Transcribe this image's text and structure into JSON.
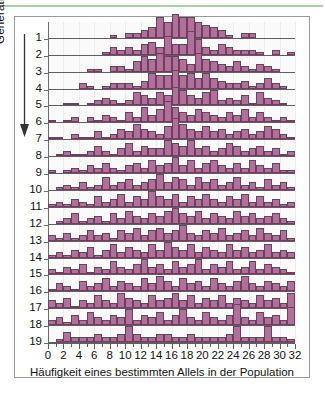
{
  "figure": {
    "y_axis_label": "Generation",
    "y_arrow_icon": "down-arrow-icon",
    "x_axis_label": "Häufigkeit eines bestimmten Allels in der Population"
  },
  "colors": {
    "bar_fill": "#b1709a",
    "bar_stroke": "#6f3f60",
    "axis": "#5e5e5e",
    "grid": "#ececf0",
    "plot_background": "#fbfafb",
    "frame": "#9a9a9a",
    "top_rule": "#a8cda8"
  },
  "chart_data": {
    "type": "bar",
    "title": "",
    "subtitle": "",
    "xlabel": "Häufigkeit eines bestimmten Allels in der Population",
    "ylabel": "Generation",
    "grid": true,
    "legend": null,
    "layout": "ridgeline / stacked small-multiple histograms, one row per generation",
    "xlim": [
      0,
      32
    ],
    "x": [
      0,
      1,
      2,
      3,
      4,
      5,
      6,
      7,
      8,
      9,
      10,
      11,
      12,
      13,
      14,
      15,
      16,
      17,
      18,
      19,
      20,
      21,
      22,
      23,
      24,
      25,
      26,
      27,
      28,
      29,
      30,
      31,
      32
    ],
    "xticks": [
      0,
      2,
      4,
      6,
      8,
      10,
      12,
      14,
      16,
      18,
      20,
      22,
      24,
      26,
      28,
      30,
      32
    ],
    "xticklabels": [
      "0",
      "2",
      "4",
      "6",
      "8",
      "10",
      "12",
      "14",
      "16",
      "18",
      "20",
      "22",
      "24",
      "26",
      "28",
      "30",
      "32"
    ],
    "minor_xticks": [
      1,
      3,
      5,
      7,
      9,
      11,
      13,
      15,
      17,
      19,
      21,
      23,
      25,
      27,
      29,
      31
    ],
    "ylabels": [
      "1",
      "2",
      "3",
      "4",
      "5",
      "6",
      "7",
      "8",
      "9",
      "10",
      "11",
      "12",
      "13",
      "14",
      "15",
      "16",
      "17",
      "18",
      "19"
    ],
    "row_max": 10,
    "series": [
      {
        "name": "1",
        "values": [
          0,
          0,
          0,
          0,
          0,
          0,
          0,
          0,
          1,
          0,
          2,
          2,
          3,
          4,
          8,
          6,
          9,
          8,
          8,
          6,
          5,
          4,
          3,
          1,
          0,
          2,
          2,
          0,
          0,
          0,
          0,
          0,
          0
        ]
      },
      {
        "name": "2",
        "values": [
          0,
          0,
          0,
          0,
          0,
          0,
          0,
          1,
          3,
          2,
          3,
          2,
          4,
          5,
          3,
          7,
          4,
          4,
          9,
          6,
          3,
          2,
          4,
          3,
          2,
          2,
          2,
          1,
          0,
          2,
          0,
          1,
          0
        ]
      },
      {
        "name": "3",
        "values": [
          0,
          0,
          0,
          0,
          0,
          1,
          1,
          0,
          2,
          2,
          1,
          4,
          6,
          5,
          7,
          6,
          6,
          5,
          3,
          7,
          5,
          4,
          3,
          2,
          4,
          2,
          1,
          3,
          2,
          1,
          0,
          0,
          0
        ]
      },
      {
        "name": "4",
        "values": [
          0,
          0,
          0,
          0,
          2,
          1,
          0,
          1,
          2,
          2,
          2,
          1,
          3,
          6,
          5,
          5,
          7,
          5,
          6,
          4,
          6,
          4,
          3,
          2,
          2,
          3,
          1,
          2,
          4,
          2,
          1,
          0,
          0
        ]
      },
      {
        "name": "5",
        "values": [
          0,
          0,
          1,
          1,
          0,
          1,
          2,
          3,
          2,
          1,
          2,
          5,
          4,
          3,
          5,
          4,
          7,
          6,
          4,
          3,
          5,
          6,
          2,
          3,
          2,
          4,
          1,
          5,
          3,
          2,
          1,
          0,
          0
        ]
      },
      {
        "name": "6",
        "values": [
          1,
          0,
          1,
          2,
          0,
          2,
          1,
          3,
          2,
          1,
          4,
          2,
          6,
          3,
          5,
          8,
          6,
          4,
          3,
          5,
          4,
          3,
          2,
          4,
          3,
          5,
          2,
          4,
          2,
          1,
          2,
          1,
          0
        ]
      },
      {
        "name": "7",
        "values": [
          1,
          1,
          0,
          2,
          1,
          1,
          3,
          1,
          2,
          4,
          3,
          6,
          4,
          3,
          2,
          5,
          8,
          6,
          4,
          3,
          5,
          3,
          4,
          2,
          3,
          4,
          2,
          3,
          5,
          4,
          2,
          1,
          0
        ]
      },
      {
        "name": "8",
        "values": [
          0,
          1,
          2,
          1,
          1,
          2,
          4,
          2,
          1,
          3,
          5,
          2,
          4,
          3,
          3,
          6,
          5,
          4,
          6,
          3,
          4,
          2,
          3,
          5,
          4,
          2,
          3,
          4,
          2,
          3,
          1,
          2,
          0
        ]
      },
      {
        "name": "9",
        "values": [
          1,
          0,
          1,
          2,
          1,
          3,
          2,
          4,
          2,
          1,
          3,
          4,
          2,
          5,
          3,
          4,
          6,
          3,
          5,
          2,
          4,
          5,
          3,
          2,
          4,
          2,
          5,
          3,
          2,
          4,
          1,
          1,
          0
        ]
      },
      {
        "name": "10",
        "values": [
          0,
          1,
          2,
          1,
          3,
          1,
          2,
          5,
          2,
          3,
          4,
          2,
          3,
          4,
          6,
          3,
          5,
          4,
          2,
          5,
          3,
          4,
          2,
          3,
          5,
          2,
          3,
          1,
          4,
          2,
          3,
          1,
          0
        ]
      },
      {
        "name": "11",
        "values": [
          1,
          2,
          1,
          3,
          2,
          1,
          4,
          2,
          3,
          5,
          2,
          4,
          3,
          6,
          4,
          3,
          5,
          2,
          4,
          3,
          5,
          3,
          2,
          4,
          3,
          5,
          2,
          4,
          2,
          3,
          1,
          2,
          0
        ]
      },
      {
        "name": "12",
        "values": [
          0,
          1,
          2,
          4,
          1,
          2,
          3,
          1,
          4,
          2,
          5,
          3,
          2,
          4,
          3,
          5,
          6,
          4,
          3,
          5,
          2,
          4,
          3,
          2,
          5,
          3,
          4,
          2,
          3,
          4,
          2,
          1,
          0
        ]
      },
      {
        "name": "13",
        "values": [
          2,
          1,
          3,
          1,
          2,
          4,
          2,
          3,
          1,
          4,
          3,
          5,
          2,
          4,
          5,
          3,
          4,
          6,
          3,
          2,
          4,
          3,
          5,
          2,
          3,
          4,
          2,
          5,
          3,
          2,
          4,
          1,
          0
        ]
      },
      {
        "name": "14",
        "values": [
          1,
          2,
          1,
          3,
          2,
          4,
          1,
          3,
          5,
          2,
          4,
          3,
          2,
          5,
          3,
          6,
          4,
          3,
          5,
          2,
          4,
          3,
          2,
          5,
          3,
          4,
          2,
          3,
          5,
          2,
          3,
          2,
          0
        ]
      },
      {
        "name": "15",
        "values": [
          2,
          1,
          3,
          2,
          4,
          1,
          3,
          2,
          5,
          3,
          2,
          4,
          6,
          3,
          4,
          2,
          5,
          3,
          4,
          6,
          2,
          4,
          3,
          5,
          2,
          3,
          5,
          2,
          4,
          3,
          2,
          1,
          0
        ]
      },
      {
        "name": "16",
        "values": [
          1,
          3,
          2,
          1,
          4,
          2,
          3,
          5,
          2,
          4,
          3,
          2,
          5,
          3,
          6,
          4,
          2,
          5,
          3,
          4,
          2,
          5,
          3,
          2,
          4,
          6,
          3,
          2,
          4,
          3,
          2,
          4,
          0
        ]
      },
      {
        "name": "17",
        "values": [
          3,
          2,
          4,
          1,
          3,
          2,
          5,
          3,
          2,
          6,
          4,
          3,
          2,
          5,
          3,
          4,
          6,
          3,
          5,
          2,
          4,
          3,
          5,
          2,
          4,
          3,
          2,
          5,
          3,
          4,
          2,
          6,
          0
        ]
      },
      {
        "name": "18",
        "values": [
          2,
          3,
          1,
          4,
          2,
          5,
          3,
          2,
          4,
          3,
          6,
          2,
          4,
          3,
          5,
          2,
          4,
          6,
          3,
          2,
          5,
          3,
          2,
          4,
          8,
          3,
          2,
          5,
          3,
          4,
          2,
          7,
          0
        ]
      },
      {
        "name": "19",
        "values": [
          0,
          1,
          4,
          2,
          2,
          2,
          3,
          2,
          2,
          3,
          6,
          3,
          2,
          2,
          3,
          3,
          2,
          2,
          3,
          2,
          2,
          2,
          2,
          3,
          6,
          2,
          2,
          2,
          6,
          2,
          2,
          1,
          0
        ]
      }
    ]
  }
}
